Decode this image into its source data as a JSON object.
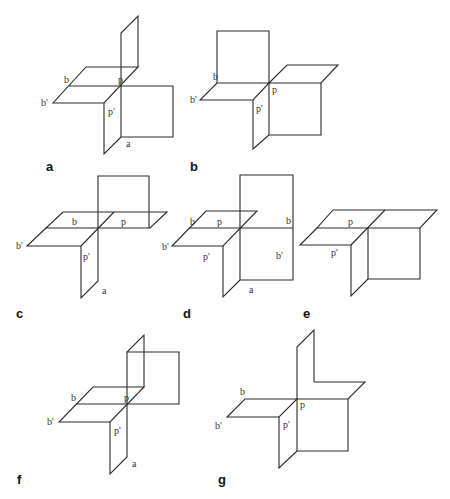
{
  "figure": {
    "panels": [
      {
        "id": "a",
        "label": "a",
        "point_labels": {
          "b": "b",
          "b_prime": "b'",
          "p": "p",
          "p_prime": "p'",
          "a": "a"
        }
      },
      {
        "id": "b",
        "label": "b",
        "point_labels": {
          "b": "b",
          "b_prime": "b'",
          "p": "p",
          "p_prime": "p'"
        }
      },
      {
        "id": "c",
        "label": "c",
        "point_labels": {
          "b": "b",
          "b_prime": "b'",
          "p": "p",
          "p_prime": "p'",
          "a": "a"
        }
      },
      {
        "id": "d",
        "label": "d",
        "point_labels": {
          "b": "b",
          "b_prime": "b'",
          "p": "p",
          "p_prime": "p'",
          "a": "a",
          "b_right": "b",
          "b_prime_right": "b'"
        }
      },
      {
        "id": "e",
        "label": "e",
        "point_labels": {
          "p": "p",
          "p_prime": "p'"
        }
      },
      {
        "id": "f",
        "label": "f",
        "point_labels": {
          "b": "b",
          "b_prime": "b'",
          "p": "p",
          "p_prime": "p'",
          "a": "a"
        }
      },
      {
        "id": "g",
        "label": "g",
        "point_labels": {
          "b": "b",
          "b_prime": "b'",
          "p": "p",
          "p_prime": "p'"
        }
      }
    ]
  }
}
